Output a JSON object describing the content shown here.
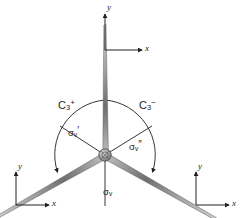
{
  "figure": {
    "background_color": "#ffffff",
    "line_color": "#231f20",
    "blade_color": "#8a8a8a"
  },
  "axes": [
    {
      "id": "top",
      "y_label": "y",
      "x_label": "x",
      "origin": [
        105,
        50
      ],
      "y_tip": [
        105,
        12
      ],
      "x_tip": [
        144,
        50
      ]
    },
    {
      "id": "bottom-left",
      "y_label": "y",
      "x_label": "x",
      "origin": [
        16,
        205
      ],
      "y_tip": [
        16,
        170
      ],
      "x_tip": [
        51,
        205
      ]
    },
    {
      "id": "bottom-right",
      "y_label": "y",
      "x_label": "x",
      "origin": [
        196,
        205
      ],
      "y_tip": [
        196,
        170
      ],
      "x_tip": [
        231,
        205
      ]
    }
  ],
  "operations": [
    {
      "id": "c3-plus",
      "symbol": "C",
      "sub": "3",
      "sup": "+",
      "x": 58,
      "y": 99
    },
    {
      "id": "c3-minus",
      "symbol": "C",
      "sub": "3",
      "sup": "−",
      "x": 139,
      "y": 99
    }
  ],
  "mirror_planes": [
    {
      "id": "sigma-v-prime",
      "symbol": "σ",
      "sub": "v",
      "prime": "′",
      "x": 68,
      "y": 127
    },
    {
      "id": "sigma-v-double-prime",
      "symbol": "σ",
      "sub": "v",
      "prime": "″",
      "x": 129,
      "y": 141
    },
    {
      "id": "sigma-v",
      "symbol": "σ",
      "sub": "v",
      "prime": "",
      "x": 103,
      "y": 186
    }
  ],
  "propeller": {
    "hub": {
      "cx": 105,
      "cy": 155,
      "r": 6
    },
    "blade_count": 3,
    "blade_angles_deg": [
      270,
      30,
      150
    ],
    "blade_length": 130
  },
  "rotation_arcs": [
    {
      "id": "arc-c3-plus",
      "direction": "counterclockwise-indicator",
      "arrow_at": "bottom-left"
    },
    {
      "id": "arc-c3-minus",
      "direction": "clockwise-indicator",
      "arrow_at": "bottom-right"
    }
  ]
}
